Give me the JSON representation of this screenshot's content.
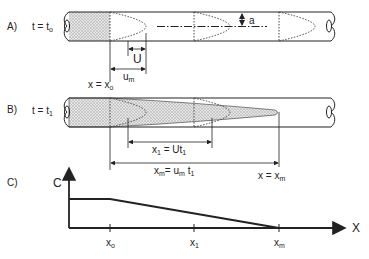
{
  "panels": {
    "a": {
      "letter": "A)",
      "time_label": "t = t",
      "time_sub": "o",
      "velocity_U": "U",
      "velocity_um": "u",
      "velocity_um_sub": "m",
      "radius_label": "a",
      "position_label": "x = x",
      "position_sub": "o"
    },
    "b": {
      "letter": "B)",
      "time_label": "t = t",
      "time_sub": "1",
      "x1_label": "x",
      "x1_sub": "1",
      "x1_eq": " = Ut",
      "x1_eq_sub": "1",
      "xm_label": "x",
      "xm_sub": "m",
      "xm_eq": "= u",
      "xm_eq_sub": "m",
      "xm_eq_t": " t",
      "xm_eq_t_sub": "1",
      "position_label": "x = x",
      "position_sub": "m"
    },
    "c": {
      "letter": "C)",
      "y_axis_label": "C",
      "x_axis_label": "X",
      "ticks": [
        {
          "label": "x",
          "sub": "o"
        },
        {
          "label": "x",
          "sub": "1"
        },
        {
          "label": "x",
          "sub": "m"
        }
      ]
    }
  },
  "colors": {
    "line": "#222222",
    "stipple": "#b8b8b8"
  }
}
